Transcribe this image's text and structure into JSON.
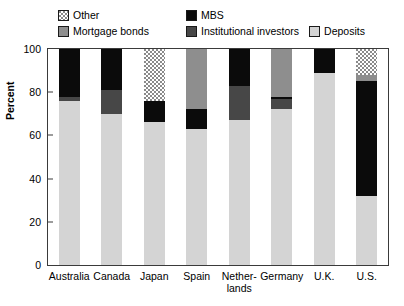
{
  "chart_data": {
    "type": "bar",
    "subtype": "stacked-bar-100",
    "title": "",
    "xlabel": "",
    "ylabel": "Percent",
    "ylim": [
      0,
      100
    ],
    "yticks": [
      0,
      20,
      40,
      60,
      80,
      100
    ],
    "ytick_labels": [
      "0",
      "20",
      "40",
      "60",
      "80",
      "100"
    ],
    "grid": false,
    "legend_position": "top",
    "categories": [
      "Australia",
      "Canada",
      "Japan",
      "Spain",
      "Nether-\nlands",
      "Germany",
      "U.K.",
      "U.S."
    ],
    "category_labels": [
      "Australia",
      "Canada",
      "Japan",
      "Spain",
      "Nether-lands",
      "Germany",
      "U.K.",
      "U.S."
    ],
    "series": [
      {
        "name": "Deposits",
        "key": "deposits",
        "color": "#d4d4d4",
        "pattern": "solid",
        "values": [
          76,
          70,
          66,
          63,
          67,
          72,
          89,
          32
        ]
      },
      {
        "name": "Institutional investors",
        "key": "institutional",
        "color": "#474747",
        "pattern": "solid",
        "values": [
          2,
          11,
          0,
          0,
          16,
          5,
          0,
          0
        ]
      },
      {
        "name": "MBS",
        "key": "mbs",
        "color": "#0b0b0b",
        "pattern": "solid",
        "values": [
          22,
          19,
          10,
          9,
          17,
          1,
          11,
          53
        ]
      },
      {
        "name": "Mortgage bonds",
        "key": "mortgage_bonds",
        "color": "#8e8e8e",
        "pattern": "solid",
        "values": [
          0,
          0,
          0,
          28,
          0,
          22,
          0,
          3
        ]
      },
      {
        "name": "Other",
        "key": "other",
        "color": "#ffffff",
        "pattern": "dotted",
        "values": [
          0,
          0,
          24,
          0,
          0,
          0,
          0,
          12
        ]
      }
    ],
    "stack_order_bottom_to_top": [
      "deposits",
      "institutional",
      "mbs",
      "mortgage_bonds",
      "other"
    ]
  },
  "legend": {
    "rows": [
      [
        {
          "label": "Other",
          "key": "other"
        },
        {
          "label": "MBS",
          "key": "mbs"
        }
      ],
      [
        {
          "label": "Mortgage bonds",
          "key": "mortgage_bonds"
        },
        {
          "label": "Institutional investors",
          "key": "institutional"
        },
        {
          "label": "Deposits",
          "key": "deposits"
        }
      ]
    ]
  }
}
